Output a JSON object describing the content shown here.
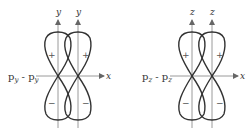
{
  "figures": [
    {
      "name": "py-py",
      "bond_label": "p",
      "bond_sub": "y",
      "bond_dash": " - ",
      "axis_vertical": "y",
      "axis_horizontal": "x",
      "sign_top": "+",
      "sign_bottom": "−"
    },
    {
      "name": "pz-pz",
      "bond_label": "p",
      "bond_sub": "z",
      "bond_dash": " - ",
      "axis_vertical": "z",
      "axis_horizontal": "x",
      "sign_top": "+",
      "sign_bottom": "−"
    }
  ]
}
